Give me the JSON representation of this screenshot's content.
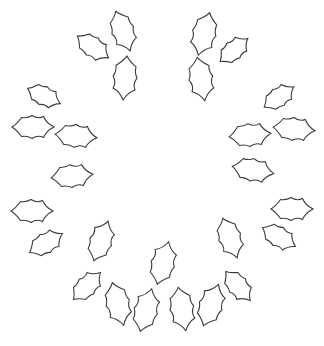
{
  "image": {
    "description": "Holly leaf outlines arranged in a wreath (ring) shape on a white background",
    "width": 324,
    "height": 346,
    "colors": {
      "background": "#ffffff",
      "outline": "#3a3a3a",
      "leaf_fill": "#ffffff"
    }
  },
  "wreath": {
    "leaf_count": 27,
    "leaves": [
      {
        "id": "leaf-1",
        "cx": 93,
        "cy": 47,
        "angle": 35,
        "length": 38
      },
      {
        "id": "leaf-2",
        "cx": 123,
        "cy": 31,
        "angle": 70,
        "length": 42
      },
      {
        "id": "leaf-3",
        "cx": 125,
        "cy": 78,
        "angle": 95,
        "length": 44
      },
      {
        "id": "leaf-4",
        "cx": 204,
        "cy": 34,
        "angle": 105,
        "length": 44
      },
      {
        "id": "leaf-5",
        "cx": 234,
        "cy": 50,
        "angle": -40,
        "length": 36
      },
      {
        "id": "leaf-6",
        "cx": 201,
        "cy": 79,
        "angle": 80,
        "length": 44
      },
      {
        "id": "leaf-7",
        "cx": 44,
        "cy": 96,
        "angle": 25,
        "length": 36
      },
      {
        "id": "leaf-8",
        "cx": 33,
        "cy": 127,
        "angle": 0,
        "length": 42
      },
      {
        "id": "leaf-9",
        "cx": 76,
        "cy": 136,
        "angle": 5,
        "length": 42
      },
      {
        "id": "leaf-10",
        "cx": 72,
        "cy": 176,
        "angle": -5,
        "length": 42
      },
      {
        "id": "leaf-11",
        "cx": 32,
        "cy": 211,
        "angle": 0,
        "length": 42
      },
      {
        "id": "leaf-12",
        "cx": 46,
        "cy": 243,
        "angle": -30,
        "length": 38
      },
      {
        "id": "leaf-13",
        "cx": 279,
        "cy": 97,
        "angle": -35,
        "length": 36
      },
      {
        "id": "leaf-14",
        "cx": 250,
        "cy": 135,
        "angle": -5,
        "length": 42
      },
      {
        "id": "leaf-15",
        "cx": 294,
        "cy": 129,
        "angle": 5,
        "length": 42
      },
      {
        "id": "leaf-16",
        "cx": 253,
        "cy": 170,
        "angle": 10,
        "length": 42
      },
      {
        "id": "leaf-17",
        "cx": 292,
        "cy": 209,
        "angle": 0,
        "length": 42
      },
      {
        "id": "leaf-18",
        "cx": 279,
        "cy": 237,
        "angle": 30,
        "length": 38
      },
      {
        "id": "leaf-19",
        "cx": 101,
        "cy": 241,
        "angle": -70,
        "length": 42
      },
      {
        "id": "leaf-20",
        "cx": 87,
        "cy": 286,
        "angle": -45,
        "length": 38
      },
      {
        "id": "leaf-21",
        "cx": 118,
        "cy": 304,
        "angle": 75,
        "length": 44
      },
      {
        "id": "leaf-22",
        "cx": 146,
        "cy": 310,
        "angle": -75,
        "length": 44
      },
      {
        "id": "leaf-23",
        "cx": 163,
        "cy": 263,
        "angle": -75,
        "length": 44
      },
      {
        "id": "leaf-24",
        "cx": 182,
        "cy": 309,
        "angle": 80,
        "length": 44
      },
      {
        "id": "leaf-25",
        "cx": 211,
        "cy": 305,
        "angle": -70,
        "length": 44
      },
      {
        "id": "leaf-26",
        "cx": 230,
        "cy": 238,
        "angle": 70,
        "length": 42
      },
      {
        "id": "leaf-27",
        "cx": 238,
        "cy": 286,
        "angle": 50,
        "length": 38
      }
    ]
  }
}
